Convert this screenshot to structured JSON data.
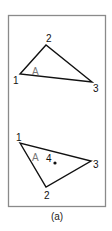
{
  "figure": {
    "caption": "(a)",
    "frame": {
      "x": 8,
      "y": 15,
      "width": 98,
      "height": 192,
      "stroke": "#8a8a8a"
    },
    "top_triangle": {
      "vertices": [
        {
          "id": "1",
          "x": 20,
          "y": 74
        },
        {
          "id": "2",
          "x": 46,
          "y": 45
        },
        {
          "id": "3",
          "x": 92,
          "y": 82
        }
      ],
      "labels": {
        "v1": "1",
        "v2": "2",
        "v3": "3",
        "region": "A"
      }
    },
    "bottom_triangle": {
      "vertices": [
        {
          "id": "1",
          "x": 20,
          "y": 143
        },
        {
          "id": "2",
          "x": 46,
          "y": 187
        },
        {
          "id": "3",
          "x": 91,
          "y": 161
        }
      ],
      "labels": {
        "v1": "1",
        "v2": "2",
        "v3": "3",
        "region": "A",
        "point": "4"
      },
      "point": {
        "x": 55,
        "y": 163
      }
    },
    "colors": {
      "line": "#111111",
      "region_label": "#777777",
      "frame": "#8a8a8a"
    }
  }
}
